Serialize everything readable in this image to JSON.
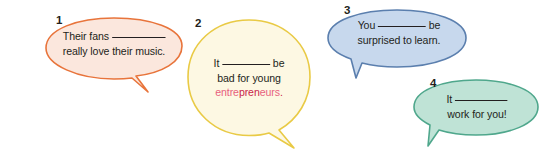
{
  "page": {
    "background_color": "#ffffff",
    "width": 544,
    "height": 153
  },
  "bubbles": [
    {
      "number": "1",
      "color_name": "orange",
      "fill_color": "#fbe7dd",
      "stroke_color": "#e8743b",
      "tail_direction": "down-right",
      "line1_before": "Their fans",
      "line1_after": "",
      "line2": "really love their music.",
      "blank": "__________"
    },
    {
      "number": "2",
      "color_name": "yellow",
      "fill_color": "#fdf8e3",
      "stroke_color": "#e9ca45",
      "tail_direction": "down-right",
      "line1_before": "It",
      "line1_after": "be",
      "line2": "bad for young",
      "line3_segments": [
        {
          "text": "entre",
          "color": "#e8607e"
        },
        {
          "text": "pren",
          "color": "#c9254a"
        },
        {
          "text": "eurs",
          "color": "#e8607e"
        },
        {
          "text": ".",
          "color": "#c9254a"
        }
      ],
      "line3_plain": "entrepreneurs.",
      "blank": "__________"
    },
    {
      "number": "3",
      "color_name": "blue",
      "fill_color": "#c7d8ed",
      "stroke_color": "#5b7fae",
      "tail_direction": "down-left",
      "line1_before": "You",
      "line1_after": "be",
      "line2": "surprised to learn.",
      "blank": "__________"
    },
    {
      "number": "4",
      "color_name": "green",
      "fill_color": "#bfe3d6",
      "stroke_color": "#4fa78c",
      "tail_direction": "down-left",
      "line1_before": "It",
      "line1_after": "",
      "line2": "work for you!",
      "blank": "__________"
    }
  ]
}
